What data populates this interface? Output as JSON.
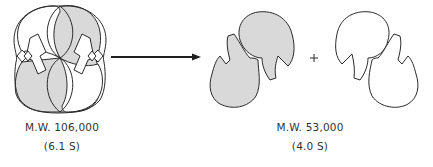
{
  "figure": {
    "dimer": {
      "molecular_weight_label": "M.W. 106,000",
      "sedimentation_label": "(6.1 S)"
    },
    "reaction": {
      "arrow": "arrow-right",
      "operator": "+"
    },
    "monomer": {
      "molecular_weight_label": "M.W. 53,000",
      "sedimentation_label": "(4.0 S)"
    },
    "colors": {
      "outline": "#2b2b2b",
      "shaded_fill": "#d9d9d9",
      "unshaded_fill": "#ffffff",
      "background": "#ffffff"
    }
  }
}
